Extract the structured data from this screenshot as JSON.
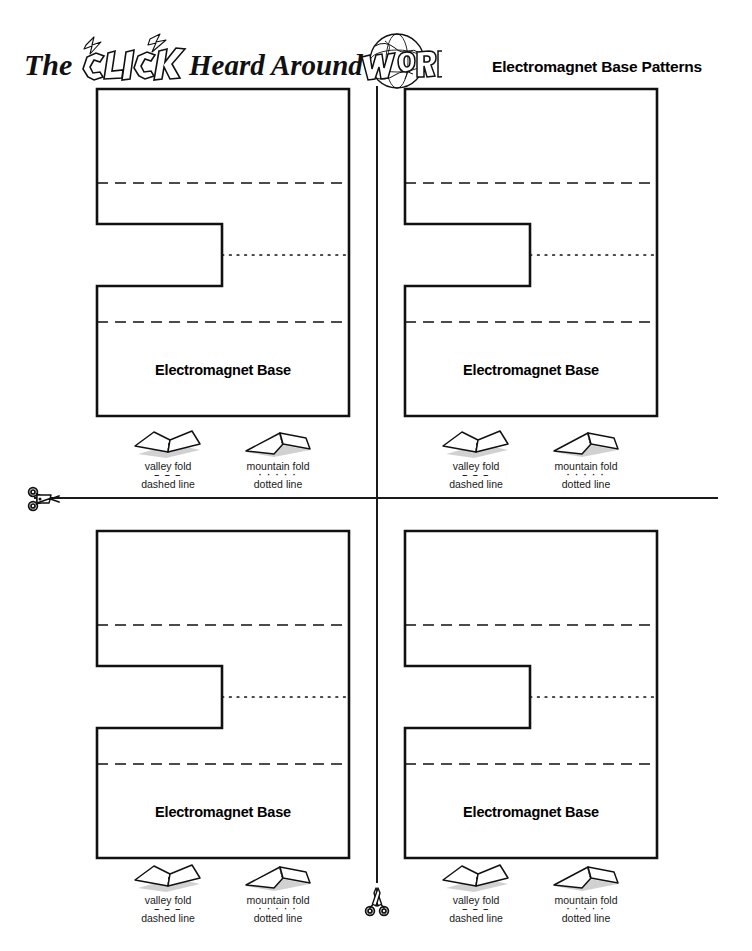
{
  "page": {
    "width": 752,
    "height": 951,
    "background": "#ffffff",
    "ink": "#000000"
  },
  "header": {
    "logo_text_the": "The",
    "logo_text_click": "CLICK",
    "logo_text_heard_around": "Heard Around the",
    "logo_text_world": "WORLD",
    "logo_alt": "The CLICK Heard Around the World",
    "title": "Electromagnet Base Patterns"
  },
  "cut_guides": {
    "vertical_label": "vertical-cut-line",
    "horizontal_label": "horizontal-cut-line",
    "scissors_glyph": "scissors-icon"
  },
  "panels": [
    {
      "id": "top-left",
      "position": "tl",
      "base_label": "Electromagnet Base"
    },
    {
      "id": "top-right",
      "position": "tr",
      "base_label": "Electromagnet Base"
    },
    {
      "id": "bottom-left",
      "position": "bl",
      "base_label": "Electromagnet Base"
    },
    {
      "id": "bottom-right",
      "position": "br",
      "base_label": "Electromagnet Base"
    }
  ],
  "legend": {
    "valley": {
      "name": "valley fold",
      "line_type": "dashed line",
      "mark": "– – –"
    },
    "mountain": {
      "name": "mountain fold",
      "line_type": "dotted line",
      "mark": "· · · · ·"
    }
  },
  "pattern_geometry": {
    "outline_width": 252,
    "outline_height": 327,
    "notch_x_end": 130,
    "notch_y_start": 140,
    "notch_y_end": 202,
    "valley_fold_y": [
      99,
      238
    ],
    "mountain_fold_y": 171,
    "mountain_fold_x_start": 130
  },
  "footer": {
    "left": "",
    "middle": "",
    "right": ""
  }
}
